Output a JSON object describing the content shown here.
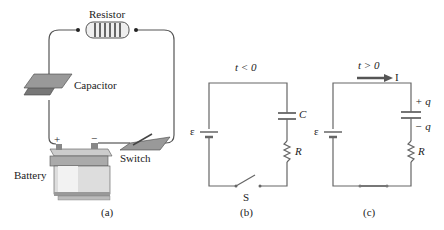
{
  "panel_a": {
    "resistor_label": "Resistor",
    "capacitor_label": "Capacitor",
    "battery_label": "Battery",
    "switch_label": "Switch",
    "plus": "+",
    "minus": "−",
    "caption": "(a)"
  },
  "panel_b": {
    "time_label": "t < 0",
    "emf": "ε",
    "capacitor": "C",
    "resistor": "R",
    "switch": "S",
    "caption": "(b)"
  },
  "panel_c": {
    "time_label": "t > 0",
    "current": "I",
    "emf": "ε",
    "plus_q": "+ q",
    "minus_q": "− q",
    "resistor": "R",
    "caption": "(c)"
  },
  "colors": {
    "wire": "#555555",
    "plate": "#8a8a8a",
    "arrow": "#555555"
  }
}
